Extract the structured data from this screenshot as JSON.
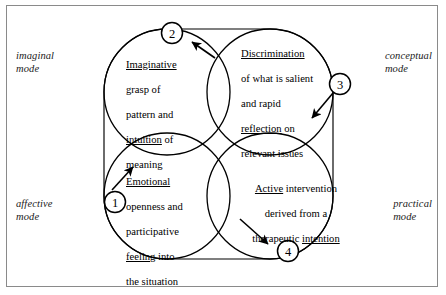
{
  "figure": {
    "background_color": "#ffffff",
    "border_color": "#8a8a8a",
    "stroke_color": "#000000"
  },
  "modes": {
    "top_left": "imaginal\nmode",
    "top_right": "conceptual\nmode",
    "bottom_left": "affective\nmode",
    "bottom_right": "practical\nmode"
  },
  "circles": [
    {
      "id": "imaginative",
      "position": "top-left",
      "marker": "2",
      "mode": "imaginal mode",
      "text_plain": "Imaginative grasp of pattern and intuition of meaning",
      "emphasis": [
        "Imaginative",
        "intuition"
      ],
      "lines": [
        "Imaginative",
        "grasp of",
        "pattern and",
        "intuition of",
        "meaning"
      ]
    },
    {
      "id": "discrimination",
      "position": "top-right",
      "marker": "3",
      "mode": "conceptual mode",
      "text_plain": "Discrimination of what is salient and rapid reflection on relevant issues",
      "emphasis": [
        "Discrimination",
        "reflection"
      ],
      "lines": [
        "Discrimination",
        "of what is salient",
        "and rapid",
        "reflection on",
        "relevant issues"
      ]
    },
    {
      "id": "emotional",
      "position": "bottom-left",
      "marker": "1",
      "mode": "affective mode",
      "text_plain": "Emotional openness and participative feeling into the situation",
      "emphasis": [
        "Emotional",
        "feeling"
      ],
      "lines": [
        "Emotional",
        "openness and",
        "participative",
        "feeling into",
        "the situation"
      ]
    },
    {
      "id": "active",
      "position": "bottom-right",
      "marker": "4",
      "mode": "practical mode",
      "text_plain": "Active intervention derived from a therapeutic intention",
      "emphasis": [
        "Active",
        "intention"
      ],
      "lines": [
        "Active intervention",
        "derived from a",
        "therapeutic intention"
      ]
    }
  ],
  "markers": [
    {
      "label": "1",
      "belongs_to": "emotional",
      "cx": 115,
      "cy": 202
    },
    {
      "label": "2",
      "belongs_to": "imaginative",
      "cx": 172,
      "cy": 33
    },
    {
      "label": "3",
      "belongs_to": "discrimination",
      "cx": 340,
      "cy": 84
    },
    {
      "label": "4",
      "belongs_to": "active",
      "cx": 288,
      "cy": 251
    }
  ],
  "arrows": [
    {
      "for_marker": "1",
      "direction": "up-right"
    },
    {
      "for_marker": "2",
      "direction": "up-left"
    },
    {
      "for_marker": "3",
      "direction": "down-left"
    },
    {
      "for_marker": "4",
      "direction": "down-right"
    }
  ]
}
